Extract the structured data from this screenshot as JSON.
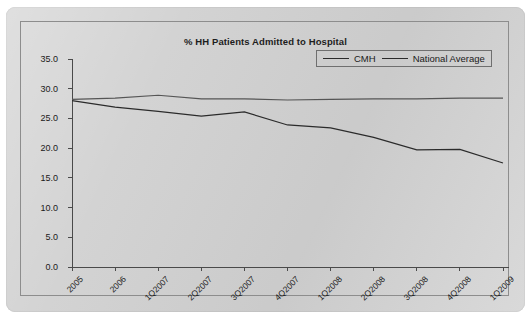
{
  "chart_data": {
    "type": "line",
    "title": "% HH Patients Admitted to Hospital",
    "xlabel": "",
    "ylabel": "",
    "ylim": [
      0.0,
      35.0
    ],
    "yticks": [
      "0.0",
      "5.0",
      "10.0",
      "15.0",
      "20.0",
      "25.0",
      "30.0",
      "35.0"
    ],
    "grid": false,
    "legend_position": "top-right",
    "categories": [
      "2005",
      "2006",
      "1Q2007",
      "2Q2007",
      "3Q2007",
      "4Q2007",
      "1Q2008",
      "2Q2008",
      "3Q2008",
      "4Q2008",
      "1Q2009"
    ],
    "series": [
      {
        "name": "CMH",
        "color": "#2b2b2b",
        "values": [
          28.0,
          26.9,
          26.2,
          25.4,
          26.1,
          23.9,
          23.4,
          21.8,
          19.7,
          19.8,
          17.5
        ]
      },
      {
        "name": "National Average",
        "color": "#555555",
        "values": [
          28.2,
          28.4,
          28.9,
          28.3,
          28.3,
          28.1,
          28.2,
          28.3,
          28.3,
          28.4,
          28.4
        ]
      }
    ]
  },
  "legend": {
    "entries": [
      {
        "label": "CMH"
      },
      {
        "label": "National Average"
      }
    ]
  }
}
